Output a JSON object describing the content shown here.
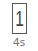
{
  "tile": {
    "glyph": "1",
    "label": "4s"
  },
  "colors": {
    "border": "#555555",
    "glyph": "#444444",
    "label": "#777777"
  }
}
